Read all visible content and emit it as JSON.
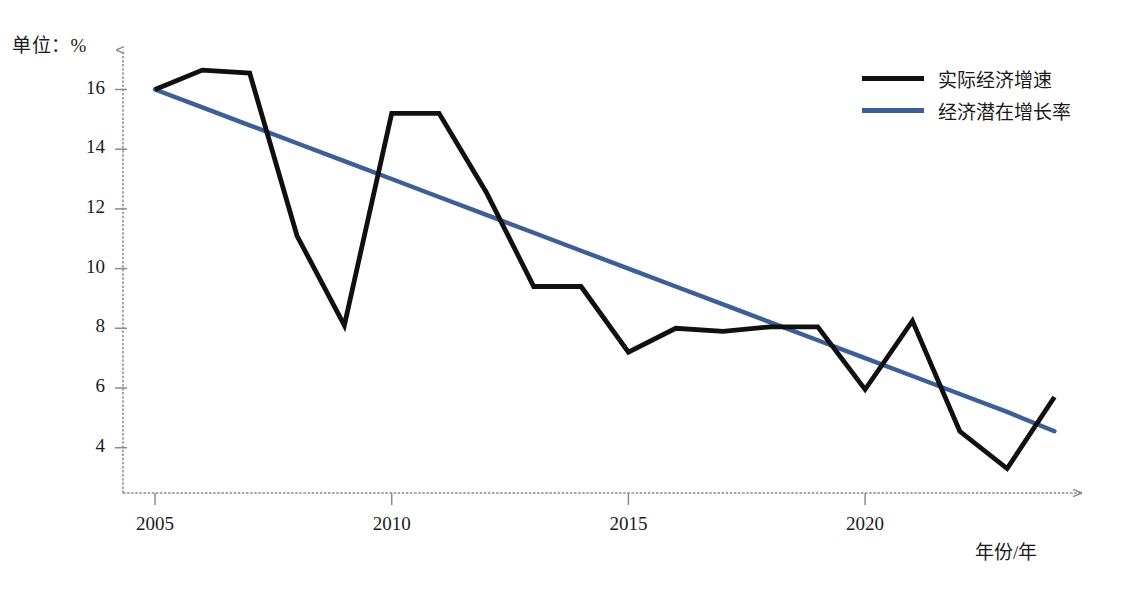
{
  "chart_data": {
    "type": "line",
    "title": "",
    "unit_label": "单位：%",
    "xlabel": "年份/年",
    "ylabel": "",
    "grid": false,
    "legend_position": "top-right",
    "x": [
      2005,
      2006,
      2007,
      2008,
      2009,
      2010,
      2011,
      2012,
      2013,
      2014,
      2015,
      2016,
      2017,
      2018,
      2019,
      2020,
      2021,
      2022,
      2023,
      2024
    ],
    "xlim": [
      2004.3,
      2024.6
    ],
    "ylim": [
      2.6,
      17.4
    ],
    "xticks": [
      2005,
      2010,
      2015,
      2020
    ],
    "xtick_labels": [
      "2005",
      "2010",
      "2015",
      "2020"
    ],
    "yticks": [
      4,
      6,
      8,
      10,
      12,
      14,
      16
    ],
    "ytick_labels": [
      "4",
      "6",
      "8",
      "10",
      "12",
      "14",
      "16"
    ],
    "series": [
      {
        "name": "实际经济增速",
        "color": "#101010",
        "values": [
          16.0,
          16.65,
          16.55,
          11.1,
          8.1,
          15.2,
          15.2,
          12.55,
          9.4,
          9.4,
          7.2,
          8.0,
          7.9,
          8.05,
          8.05,
          5.95,
          8.25,
          4.55,
          3.3,
          5.7
        ]
      },
      {
        "name": "经济潜在增长率",
        "color": "#3c5f96",
        "values": [
          16.0,
          15.4,
          14.8,
          14.2,
          13.6,
          13.0,
          12.4,
          11.8,
          11.2,
          10.6,
          10.0,
          9.4,
          8.8,
          8.2,
          7.6,
          7.0,
          6.4,
          5.8,
          5.2,
          4.55
        ]
      }
    ]
  },
  "axes": {
    "y_arrow": true,
    "x_arrow": true,
    "axis_color": "#8a8a8a"
  },
  "caption": {
    "text": ""
  }
}
